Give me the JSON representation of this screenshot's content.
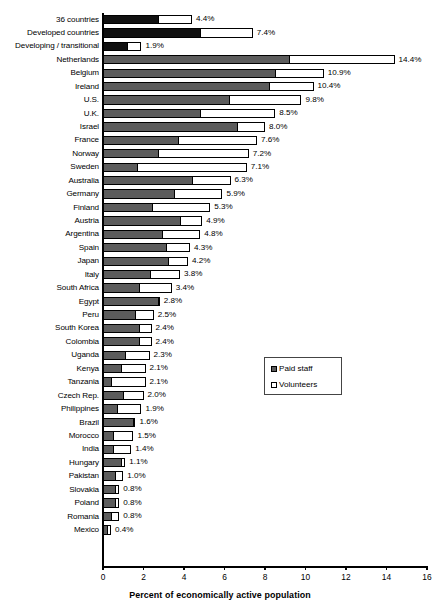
{
  "chart_data": {
    "type": "bar",
    "orientation": "horizontal",
    "stacked": true,
    "title": "",
    "xlabel": "Percent of economically active population",
    "ylabel": "",
    "xlim": [
      0,
      16
    ],
    "xticks": [
      0,
      2,
      4,
      6,
      8,
      10,
      12,
      14,
      16
    ],
    "grid": false,
    "legend_position": "middle-right",
    "legend": [
      {
        "name": "Paid staff",
        "color": "#5c5c5c"
      },
      {
        "name": "Volunteers",
        "color": "#ffffff"
      }
    ],
    "series": [
      {
        "name": "Paid staff",
        "color": "#5c5c5c"
      },
      {
        "name": "Volunteers",
        "color": "#ffffff"
      }
    ],
    "categories": [
      "36 countries",
      "Developed countries",
      "Developing / transitional",
      "Netherlands",
      "Belgium",
      "Ireland",
      "U.S.",
      "U.K.",
      "Israel",
      "France",
      "Norway",
      "Sweden",
      "Australia",
      "Germany",
      "Finland",
      "Austria",
      "Argentina",
      "Spain",
      "Japan",
      "Italy",
      "South Africa",
      "Egypt",
      "Peru",
      "South Korea",
      "Colombia",
      "Uganda",
      "Kenya",
      "Tanzania",
      "Czech Rep.",
      "Philippines",
      "Brazil",
      "Morocco",
      "India",
      "Hungary",
      "Pakistan",
      "Slovakia",
      "Poland",
      "Romania",
      "Mexico"
    ],
    "totals": [
      4.4,
      7.4,
      1.9,
      14.4,
      10.9,
      10.4,
      9.8,
      8.5,
      8.0,
      7.6,
      7.2,
      7.1,
      6.3,
      5.9,
      5.3,
      4.9,
      4.8,
      4.3,
      4.2,
      3.8,
      3.4,
      2.8,
      2.5,
      2.4,
      2.4,
      2.3,
      2.1,
      2.1,
      2.0,
      1.9,
      1.6,
      1.5,
      1.4,
      1.1,
      1.0,
      0.8,
      0.8,
      0.8,
      0.4
    ],
    "bars": [
      {
        "label": "36 countries",
        "paid": 2.7,
        "volunteers": 1.7,
        "total": 4.4,
        "total_label": "4.4%",
        "highlight": true
      },
      {
        "label": "Developed countries",
        "paid": 4.8,
        "volunteers": 2.6,
        "total": 7.4,
        "total_label": "7.4%",
        "highlight": true
      },
      {
        "label": "Developing / transitional",
        "paid": 1.2,
        "volunteers": 0.7,
        "total": 1.9,
        "total_label": "1.9%",
        "highlight": true
      },
      {
        "label": "Netherlands",
        "paid": 9.2,
        "volunteers": 5.2,
        "total": 14.4,
        "total_label": "14.4%",
        "highlight": false
      },
      {
        "label": "Belgium",
        "paid": 8.5,
        "volunteers": 2.4,
        "total": 10.9,
        "total_label": "10.9%",
        "highlight": false
      },
      {
        "label": "Ireland",
        "paid": 8.2,
        "volunteers": 2.2,
        "total": 10.4,
        "total_label": "10.4%",
        "highlight": false
      },
      {
        "label": "U.S.",
        "paid": 6.2,
        "volunteers": 3.6,
        "total": 9.8,
        "total_label": "9.8%",
        "highlight": false
      },
      {
        "label": "U.K.",
        "paid": 4.8,
        "volunteers": 3.7,
        "total": 8.5,
        "total_label": "8.5%",
        "highlight": false
      },
      {
        "label": "Israel",
        "paid": 6.6,
        "volunteers": 1.4,
        "total": 8.0,
        "total_label": "8.0%",
        "highlight": false
      },
      {
        "label": "France",
        "paid": 3.7,
        "volunteers": 3.9,
        "total": 7.6,
        "total_label": "7.6%",
        "highlight": false
      },
      {
        "label": "Norway",
        "paid": 2.7,
        "volunteers": 4.5,
        "total": 7.2,
        "total_label": "7.2%",
        "highlight": false
      },
      {
        "label": "Sweden",
        "paid": 1.7,
        "volunteers": 5.4,
        "total": 7.1,
        "total_label": "7.1%",
        "highlight": false
      },
      {
        "label": "Australia",
        "paid": 4.4,
        "volunteers": 1.9,
        "total": 6.3,
        "total_label": "6.3%",
        "highlight": false
      },
      {
        "label": "Germany",
        "paid": 3.5,
        "volunteers": 2.4,
        "total": 5.9,
        "total_label": "5.9%",
        "highlight": false
      },
      {
        "label": "Finland",
        "paid": 2.4,
        "volunteers": 2.9,
        "total": 5.3,
        "total_label": "5.3%",
        "highlight": false
      },
      {
        "label": "Austria",
        "paid": 3.8,
        "volunteers": 1.1,
        "total": 4.9,
        "total_label": "4.9%",
        "highlight": false
      },
      {
        "label": "Argentina",
        "paid": 2.9,
        "volunteers": 1.9,
        "total": 4.8,
        "total_label": "4.8%",
        "highlight": false
      },
      {
        "label": "Spain",
        "paid": 3.1,
        "volunteers": 1.2,
        "total": 4.3,
        "total_label": "4.3%",
        "highlight": false
      },
      {
        "label": "Japan",
        "paid": 3.2,
        "volunteers": 1.0,
        "total": 4.2,
        "total_label": "4.2%",
        "highlight": false
      },
      {
        "label": "Italy",
        "paid": 2.3,
        "volunteers": 1.5,
        "total": 3.8,
        "total_label": "3.8%",
        "highlight": false
      },
      {
        "label": "South Africa",
        "paid": 1.8,
        "volunteers": 1.6,
        "total": 3.4,
        "total_label": "3.4%",
        "highlight": false
      },
      {
        "label": "Egypt",
        "paid": 2.7,
        "volunteers": 0.1,
        "total": 2.8,
        "total_label": "2.8%",
        "highlight": false
      },
      {
        "label": "Peru",
        "paid": 1.6,
        "volunteers": 0.9,
        "total": 2.5,
        "total_label": "2.5%",
        "highlight": false
      },
      {
        "label": "South Korea",
        "paid": 1.8,
        "volunteers": 0.6,
        "total": 2.4,
        "total_label": "2.4%",
        "highlight": false
      },
      {
        "label": "Colombia",
        "paid": 1.8,
        "volunteers": 0.6,
        "total": 2.4,
        "total_label": "2.4%",
        "highlight": false
      },
      {
        "label": "Uganda",
        "paid": 1.1,
        "volunteers": 1.2,
        "total": 2.3,
        "total_label": "2.3%",
        "highlight": false
      },
      {
        "label": "Kenya",
        "paid": 0.9,
        "volunteers": 1.2,
        "total": 2.1,
        "total_label": "2.1%",
        "highlight": false
      },
      {
        "label": "Tanzania",
        "paid": 0.4,
        "volunteers": 1.7,
        "total": 2.1,
        "total_label": "2.1%",
        "highlight": false
      },
      {
        "label": "Czech Rep.",
        "paid": 1.0,
        "volunteers": 1.0,
        "total": 2.0,
        "total_label": "2.0%",
        "highlight": false
      },
      {
        "label": "Philippines",
        "paid": 0.7,
        "volunteers": 1.2,
        "total": 1.9,
        "total_label": "1.9%",
        "highlight": false
      },
      {
        "label": "Brazil",
        "paid": 1.5,
        "volunteers": 0.1,
        "total": 1.6,
        "total_label": "1.6%",
        "highlight": false
      },
      {
        "label": "Morocco",
        "paid": 0.5,
        "volunteers": 1.0,
        "total": 1.5,
        "total_label": "1.5%",
        "highlight": false
      },
      {
        "label": "India",
        "paid": 0.5,
        "volunteers": 0.9,
        "total": 1.4,
        "total_label": "1.4%",
        "highlight": false
      },
      {
        "label": "Hungary",
        "paid": 0.9,
        "volunteers": 0.2,
        "total": 1.1,
        "total_label": "1.1%",
        "highlight": false
      },
      {
        "label": "Pakistan",
        "paid": 0.6,
        "volunteers": 0.4,
        "total": 1.0,
        "total_label": "1.0%",
        "highlight": false
      },
      {
        "label": "Slovakia",
        "paid": 0.6,
        "volunteers": 0.2,
        "total": 0.8,
        "total_label": "0.8%",
        "highlight": false
      },
      {
        "label": "Poland",
        "paid": 0.6,
        "volunteers": 0.2,
        "total": 0.8,
        "total_label": "0.8%",
        "highlight": false
      },
      {
        "label": "Romania",
        "paid": 0.4,
        "volunteers": 0.4,
        "total": 0.8,
        "total_label": "0.8%",
        "highlight": false
      },
      {
        "label": "Mexico",
        "paid": 0.2,
        "volunteers": 0.2,
        "total": 0.4,
        "total_label": "0.4%",
        "highlight": false
      }
    ]
  },
  "axis": {
    "x_title": "Percent of economically active population",
    "x_tick_labels": [
      "0",
      "2",
      "4",
      "6",
      "8",
      "10",
      "12",
      "14",
      "16"
    ]
  },
  "legend": {
    "items": [
      {
        "label": "Paid staff",
        "swatch": "paid"
      },
      {
        "label": "Volunteers",
        "swatch": "vol"
      }
    ]
  },
  "colors": {
    "paid": "#5c5c5c",
    "paid_highlight": "#111111",
    "volunteers": "#ffffff",
    "outline": "#000000"
  }
}
